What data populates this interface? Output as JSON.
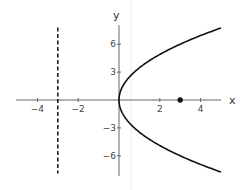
{
  "chart_data": {
    "type": "line",
    "title": "",
    "xlabel": "x",
    "ylabel": "y",
    "xlim": [
      -5.1,
      5
    ],
    "ylim": [
      -8,
      8
    ],
    "grid": false,
    "x_ticks": [
      -4,
      -2,
      2,
      4
    ],
    "x_tick_labels": [
      "−4",
      "−2",
      "2",
      "4"
    ],
    "y_ticks": [
      6,
      3,
      -3,
      -6
    ],
    "y_tick_labels": [
      "6",
      "3",
      "−3",
      "−6"
    ],
    "series": [
      {
        "name": "parabola",
        "equation": "y^2 = 12x",
        "style": "solid",
        "color": "#111111",
        "x": [
          5,
          4,
          3,
          2,
          1,
          0.5,
          0.2,
          0,
          0.2,
          0.5,
          1,
          2,
          3,
          4,
          5
        ],
        "y": [
          7.75,
          6.93,
          6,
          4.9,
          3.46,
          2.45,
          1.55,
          0,
          -1.55,
          -2.45,
          -3.46,
          -4.9,
          -6,
          -6.93,
          -7.75
        ]
      },
      {
        "name": "directrix",
        "equation": "x = -3",
        "style": "dashed",
        "color": "#111111",
        "x": [
          -3,
          -3
        ],
        "y": [
          -7.9,
          7.8
        ]
      }
    ],
    "points": [
      {
        "name": "focus",
        "x": 3,
        "y": 0,
        "color": "#111111"
      }
    ]
  }
}
